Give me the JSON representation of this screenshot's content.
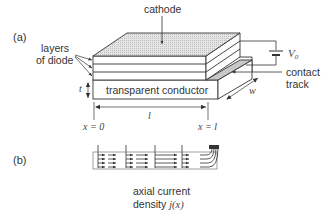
{
  "panel_a": {
    "label": "(a)",
    "labels": {
      "cathode": "cathode",
      "layers_line1": "layers",
      "layers_line2": "of diode",
      "transparent_conductor": "transparent conductor",
      "voltage": "V",
      "voltage_sub": "0",
      "contact_line1": "contact",
      "contact_line2": "track",
      "thickness": "t",
      "width": "w",
      "length": "l",
      "x_start": "x = 0",
      "x_end": "x = l"
    }
  },
  "panel_b": {
    "label": "(b)",
    "caption_line1": "axial current",
    "caption_line2": "density",
    "caption_symbol": "j(x)"
  },
  "colors": {
    "line": "#333333",
    "cathode_fill": "#d9d9d9",
    "contact_fill": "#c8c8c8",
    "text": "#333333"
  }
}
